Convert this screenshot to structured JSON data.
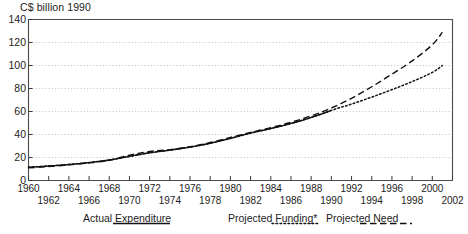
{
  "chart_data": {
    "type": "line",
    "title": "",
    "ylabel": "C$ billion 1990",
    "xlabel": "",
    "ylim": [
      0,
      140
    ],
    "ytick_step": 20,
    "yticks": [
      "0",
      "20",
      "40",
      "60",
      "80",
      "100",
      "120",
      "140"
    ],
    "xlim": [
      1960,
      2002
    ],
    "xticks_top": [
      "1960",
      "1964",
      "1968",
      "1972",
      "1976",
      "1980",
      "1984",
      "1988",
      "1992",
      "1996",
      "2000"
    ],
    "xticks_bottom": [
      "1962",
      "1966",
      "1970",
      "1974",
      "1978",
      "1982",
      "1986",
      "1990",
      "1994",
      "1998",
      "2002"
    ],
    "grid": "horizontal-dotted",
    "legend_position": "below-axis",
    "x": [
      1960,
      1961,
      1962,
      1963,
      1964,
      1965,
      1966,
      1967,
      1968,
      1969,
      1970,
      1971,
      1972,
      1973,
      1974,
      1975,
      1976,
      1977,
      1978,
      1979,
      1980,
      1981,
      1982,
      1983,
      1984,
      1985,
      1986,
      1987,
      1988,
      1989,
      1990,
      1991,
      1992,
      1993,
      1994,
      1995,
      1996,
      1997,
      1998,
      1999,
      2000,
      2001
    ],
    "series": [
      {
        "name": "Actual Expenditure",
        "style": "solid",
        "color": "#111111",
        "x": [
          1960,
          1961,
          1962,
          1963,
          1964,
          1965,
          1966,
          1967,
          1968,
          1969,
          1970,
          1971,
          1972,
          1973,
          1974,
          1975,
          1976,
          1977,
          1978,
          1979,
          1980,
          1981,
          1982,
          1983,
          1984,
          1985,
          1986,
          1987,
          1988,
          1989,
          1990
        ],
        "values": [
          11.5,
          12.0,
          12.6,
          13.2,
          13.9,
          14.7,
          15.6,
          16.6,
          17.8,
          19.3,
          21.0,
          22.6,
          24.1,
          25.3,
          26.4,
          27.6,
          29.0,
          30.6,
          32.4,
          34.4,
          36.6,
          39.0,
          41.2,
          43.2,
          45.2,
          47.3,
          49.6,
          52.0,
          54.8,
          57.8,
          61.0
        ]
      },
      {
        "name": "Projected Funding*",
        "style": "dotted",
        "color": "#111111",
        "x": [
          1960,
          1962,
          1964,
          1966,
          1968,
          1970,
          1972,
          1974,
          1976,
          1978,
          1980,
          1982,
          1984,
          1986,
          1988,
          1990,
          1992,
          1994,
          1996,
          1998,
          2000,
          2001
        ],
        "values": [
          11.5,
          12.6,
          13.9,
          15.6,
          17.8,
          21.0,
          24.1,
          26.4,
          29.0,
          32.4,
          36.6,
          41.2,
          45.2,
          49.6,
          54.8,
          61.0,
          66.5,
          72.5,
          79.0,
          86.0,
          94.0,
          100.0
        ]
      },
      {
        "name": "Projected Need",
        "style": "dashed",
        "color": "#111111",
        "x": [
          1960,
          1962,
          1964,
          1966,
          1968,
          1970,
          1972,
          1974,
          1976,
          1978,
          1980,
          1982,
          1984,
          1986,
          1988,
          1990,
          1992,
          1994,
          1996,
          1998,
          2000,
          2001
        ],
        "values": [
          11.0,
          12.2,
          13.6,
          15.3,
          17.6,
          22.0,
          25.2,
          26.8,
          29.4,
          33.0,
          37.4,
          41.8,
          46.0,
          50.6,
          56.2,
          63.0,
          71.5,
          81.5,
          92.5,
          104.0,
          118.0,
          129.0
        ]
      }
    ]
  },
  "legend": {
    "items": [
      {
        "label": "Actual Expenditure",
        "style": "solid"
      },
      {
        "label": "Projected Funding*",
        "style": "dotted"
      },
      {
        "label": "Projected Need",
        "style": "dashed"
      }
    ]
  }
}
